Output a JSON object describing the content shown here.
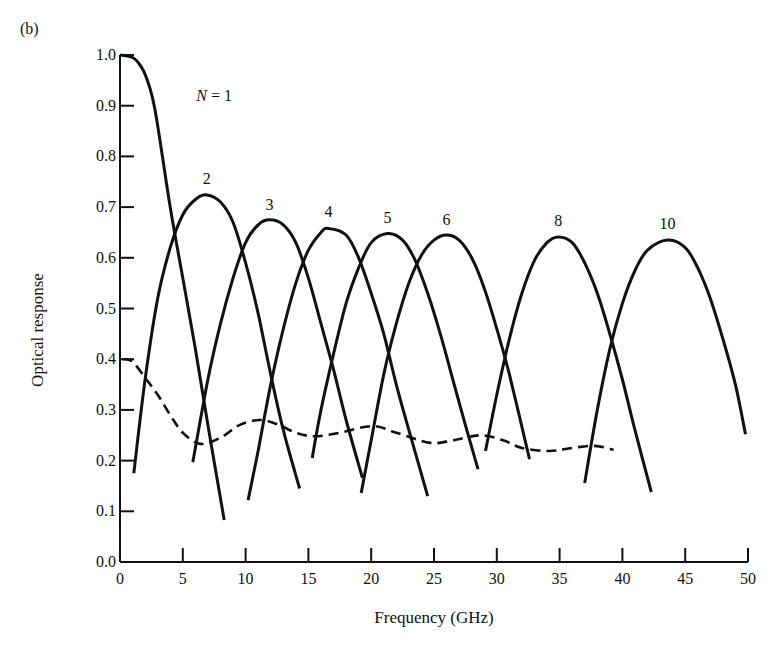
{
  "figure": {
    "panel_label": "(b)"
  },
  "chart_data": {
    "type": "line",
    "title": "",
    "xlabel": "Frequency (GHz)",
    "ylabel": "Optical response",
    "xlim": [
      0,
      50
    ],
    "ylim": [
      0.0,
      1.0
    ],
    "x_ticks": [
      "0",
      "5",
      "10",
      "15",
      "20",
      "25",
      "30",
      "35",
      "40",
      "45",
      "50"
    ],
    "y_ticks": [
      "0.0",
      "0.1",
      "0.2",
      "0.3",
      "0.4",
      "0.5",
      "0.6",
      "0.7",
      "0.8",
      "0.9",
      "1.0"
    ],
    "grid": false,
    "legend": "none (curves labeled inline)",
    "series": [
      {
        "name": "N = 1",
        "label": "N = 1",
        "style": "solid",
        "label_pos": [
          7.5,
          0.91
        ],
        "points": [
          [
            0,
            1.0
          ],
          [
            1,
            0.995
          ],
          [
            1.6,
            0.98
          ],
          [
            2.1,
            0.955
          ],
          [
            2.8,
            0.89
          ],
          [
            4,
            0.7
          ],
          [
            5,
            0.56
          ],
          [
            6,
            0.42
          ],
          [
            7,
            0.27
          ],
          [
            8.3,
            0.083
          ]
        ]
      },
      {
        "name": "N = 2",
        "label": "2",
        "style": "solid",
        "label_pos": [
          6.9,
          0.745
        ],
        "points": [
          [
            1.1,
            0.175
          ],
          [
            2,
            0.36
          ],
          [
            3,
            0.52
          ],
          [
            4,
            0.62
          ],
          [
            5,
            0.685
          ],
          [
            6,
            0.715
          ],
          [
            6.9,
            0.724
          ],
          [
            8,
            0.71
          ],
          [
            9,
            0.67
          ],
          [
            10,
            0.59
          ],
          [
            11,
            0.49
          ],
          [
            12,
            0.37
          ],
          [
            13,
            0.26
          ],
          [
            14.3,
            0.145
          ]
        ]
      },
      {
        "name": "N = 3",
        "label": "3",
        "style": "solid",
        "label_pos": [
          11.9,
          0.695
        ],
        "points": [
          [
            5.8,
            0.197
          ],
          [
            7,
            0.36
          ],
          [
            8,
            0.47
          ],
          [
            9,
            0.56
          ],
          [
            10,
            0.63
          ],
          [
            11,
            0.665
          ],
          [
            11.9,
            0.675
          ],
          [
            13,
            0.665
          ],
          [
            14,
            0.63
          ],
          [
            15,
            0.56
          ],
          [
            16,
            0.47
          ],
          [
            17,
            0.38
          ],
          [
            18,
            0.28
          ],
          [
            19.3,
            0.166
          ]
        ]
      },
      {
        "name": "N = 4",
        "label": "4",
        "style": "solid",
        "label_pos": [
          16.6,
          0.68
        ],
        "points": [
          [
            10.2,
            0.122
          ],
          [
            11,
            0.22
          ],
          [
            12,
            0.35
          ],
          [
            13,
            0.46
          ],
          [
            14,
            0.55
          ],
          [
            15,
            0.615
          ],
          [
            16,
            0.65
          ],
          [
            16.6,
            0.658
          ],
          [
            18,
            0.645
          ],
          [
            19,
            0.6
          ],
          [
            20,
            0.53
          ],
          [
            21,
            0.45
          ],
          [
            22,
            0.35
          ],
          [
            23,
            0.26
          ],
          [
            24.5,
            0.13
          ]
        ]
      },
      {
        "name": "N = 5",
        "label": "5",
        "style": "solid",
        "label_pos": [
          21.3,
          0.668
        ],
        "points": [
          [
            15.3,
            0.205
          ],
          [
            16,
            0.3
          ],
          [
            17,
            0.41
          ],
          [
            18,
            0.51
          ],
          [
            19,
            0.58
          ],
          [
            20,
            0.63
          ],
          [
            21.3,
            0.648
          ],
          [
            22.5,
            0.635
          ],
          [
            23.5,
            0.595
          ],
          [
            24.5,
            0.53
          ],
          [
            25.5,
            0.45
          ],
          [
            26.5,
            0.36
          ],
          [
            27.5,
            0.27
          ],
          [
            28.5,
            0.183
          ]
        ]
      },
      {
        "name": "N = 6",
        "label": "6",
        "style": "solid",
        "label_pos": [
          26,
          0.665
        ],
        "points": [
          [
            19.2,
            0.136
          ],
          [
            20,
            0.24
          ],
          [
            21,
            0.37
          ],
          [
            22,
            0.47
          ],
          [
            23,
            0.55
          ],
          [
            24,
            0.605
          ],
          [
            25,
            0.635
          ],
          [
            26,
            0.645
          ],
          [
            27,
            0.635
          ],
          [
            28,
            0.6
          ],
          [
            29,
            0.54
          ],
          [
            30,
            0.46
          ],
          [
            31,
            0.37
          ],
          [
            32.6,
            0.203
          ]
        ]
      },
      {
        "name": "N = 8",
        "label": "8",
        "style": "solid",
        "label_pos": [
          34.9,
          0.662
        ],
        "points": [
          [
            29.1,
            0.219
          ],
          [
            30,
            0.33
          ],
          [
            31,
            0.44
          ],
          [
            32,
            0.53
          ],
          [
            33,
            0.595
          ],
          [
            34,
            0.63
          ],
          [
            34.9,
            0.641
          ],
          [
            36,
            0.63
          ],
          [
            37,
            0.59
          ],
          [
            38,
            0.53
          ],
          [
            39,
            0.45
          ],
          [
            40,
            0.36
          ],
          [
            41,
            0.26
          ],
          [
            42.3,
            0.138
          ]
        ]
      },
      {
        "name": "N = 10",
        "label": "10",
        "style": "solid",
        "label_pos": [
          43.6,
          0.656
        ],
        "points": [
          [
            37,
            0.156
          ],
          [
            38,
            0.3
          ],
          [
            39,
            0.42
          ],
          [
            40,
            0.51
          ],
          [
            41,
            0.575
          ],
          [
            42,
            0.615
          ],
          [
            43.6,
            0.635
          ],
          [
            45,
            0.62
          ],
          [
            46,
            0.58
          ],
          [
            47,
            0.52
          ],
          [
            48,
            0.44
          ],
          [
            49,
            0.35
          ],
          [
            49.8,
            0.252
          ]
        ]
      },
      {
        "name": "envelope",
        "label": "",
        "style": "dashed",
        "points": [
          [
            0.2,
            0.4
          ],
          [
            1,
            0.395
          ],
          [
            2.1,
            0.36
          ],
          [
            3,
            0.33
          ],
          [
            4,
            0.29
          ],
          [
            5,
            0.255
          ],
          [
            6.4,
            0.233
          ],
          [
            8,
            0.245
          ],
          [
            9.5,
            0.27
          ],
          [
            11.1,
            0.28
          ],
          [
            12.5,
            0.272
          ],
          [
            14,
            0.255
          ],
          [
            15.5,
            0.248
          ],
          [
            17.5,
            0.255
          ],
          [
            20.1,
            0.268
          ],
          [
            22,
            0.255
          ],
          [
            24.7,
            0.235
          ],
          [
            26.5,
            0.24
          ],
          [
            28.7,
            0.25
          ],
          [
            30.5,
            0.24
          ],
          [
            32,
            0.225
          ],
          [
            34.2,
            0.219
          ],
          [
            36,
            0.225
          ],
          [
            37.8,
            0.229
          ],
          [
            39.3,
            0.221
          ]
        ]
      }
    ]
  }
}
